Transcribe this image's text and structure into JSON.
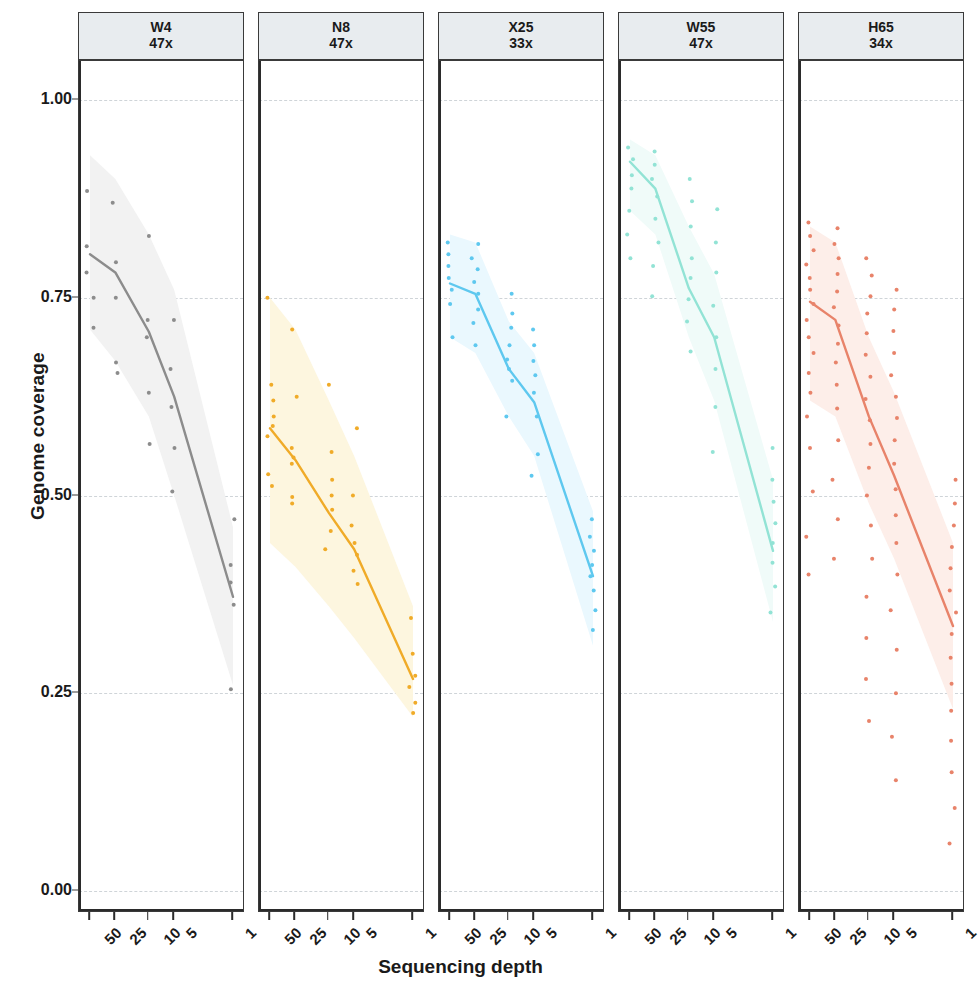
{
  "axes": {
    "y_title": "Genome coverage",
    "x_title": "Sequencing depth",
    "y_ticks": [
      "0.00",
      "0.25",
      "0.50",
      "0.75",
      "1.00"
    ],
    "x_ticks": [
      "50",
      "25",
      "10",
      "5",
      "1"
    ]
  },
  "panels": [
    {
      "name": "W4",
      "depth": "47x",
      "color": "#8c8c8c",
      "ribbon": "#f2f2f2"
    },
    {
      "name": "N8",
      "depth": "47x",
      "color": "#f0ab28",
      "ribbon": "#fdf6df"
    },
    {
      "name": "X25",
      "depth": "33x",
      "color": "#5ec8ef",
      "ribbon": "#eaf8fe"
    },
    {
      "name": "W55",
      "depth": "47x",
      "color": "#92e3d5",
      "ribbon": "#f0fbf9"
    },
    {
      "name": "H65",
      "depth": "34x",
      "color": "#e8836a",
      "ribbon": "#fdeee9"
    }
  ],
  "chart_data": {
    "type": "line",
    "title": "",
    "xlabel": "Sequencing depth",
    "ylabel": "Genome coverage",
    "x": [
      50,
      25,
      10,
      5,
      1
    ],
    "x_scale": "log-reversed",
    "ylim": [
      0.0,
      1.05
    ],
    "y_ticks": [
      0.0,
      0.25,
      0.5,
      0.75,
      1.0
    ],
    "grid": "horizontal-dashed",
    "legend": "none",
    "facets": [
      {
        "label": "W4",
        "sublabel": "47x",
        "color": "#8c8c8c",
        "ribbon_color": "#f2f2f2",
        "mean_line": [
          0.805,
          0.782,
          0.707,
          0.625,
          0.372
        ],
        "ribbon_upper": [
          0.93,
          0.9,
          0.83,
          0.76,
          0.46
        ],
        "ribbon_lower": [
          0.71,
          0.67,
          0.6,
          0.5,
          0.26
        ],
        "points": [
          {
            "x": 50,
            "y": 0.885
          },
          {
            "x": 50,
            "y": 0.815
          },
          {
            "x": 50,
            "y": 0.782
          },
          {
            "x": 50,
            "y": 0.75
          },
          {
            "x": 50,
            "y": 0.712
          },
          {
            "x": 25,
            "y": 0.87
          },
          {
            "x": 25,
            "y": 0.795
          },
          {
            "x": 25,
            "y": 0.75
          },
          {
            "x": 25,
            "y": 0.668
          },
          {
            "x": 25,
            "y": 0.655
          },
          {
            "x": 10,
            "y": 0.828
          },
          {
            "x": 10,
            "y": 0.722
          },
          {
            "x": 10,
            "y": 0.7
          },
          {
            "x": 10,
            "y": 0.63
          },
          {
            "x": 10,
            "y": 0.565
          },
          {
            "x": 5,
            "y": 0.722
          },
          {
            "x": 5,
            "y": 0.66
          },
          {
            "x": 5,
            "y": 0.612
          },
          {
            "x": 5,
            "y": 0.56
          },
          {
            "x": 5,
            "y": 0.505
          },
          {
            "x": 1,
            "y": 0.47
          },
          {
            "x": 1,
            "y": 0.412
          },
          {
            "x": 1,
            "y": 0.39
          },
          {
            "x": 1,
            "y": 0.362
          },
          {
            "x": 1,
            "y": 0.255
          }
        ]
      },
      {
        "label": "N8",
        "sublabel": "47x",
        "color": "#f0ab28",
        "ribbon_color": "#fdf6df",
        "mean_line": [
          0.585,
          0.545,
          0.478,
          0.432,
          0.268
        ],
        "ribbon_upper": [
          0.75,
          0.71,
          0.62,
          0.55,
          0.36
        ],
        "ribbon_lower": [
          0.44,
          0.41,
          0.36,
          0.32,
          0.22
        ],
        "points": [
          {
            "x": 50,
            "y": 0.75
          },
          {
            "x": 50,
            "y": 0.64
          },
          {
            "x": 50,
            "y": 0.62
          },
          {
            "x": 50,
            "y": 0.6
          },
          {
            "x": 50,
            "y": 0.588
          },
          {
            "x": 50,
            "y": 0.575
          },
          {
            "x": 50,
            "y": 0.527
          },
          {
            "x": 50,
            "y": 0.512
          },
          {
            "x": 25,
            "y": 0.71
          },
          {
            "x": 25,
            "y": 0.625
          },
          {
            "x": 25,
            "y": 0.56
          },
          {
            "x": 25,
            "y": 0.548
          },
          {
            "x": 25,
            "y": 0.54
          },
          {
            "x": 25,
            "y": 0.498
          },
          {
            "x": 25,
            "y": 0.49
          },
          {
            "x": 10,
            "y": 0.64
          },
          {
            "x": 10,
            "y": 0.555
          },
          {
            "x": 10,
            "y": 0.52
          },
          {
            "x": 10,
            "y": 0.5
          },
          {
            "x": 10,
            "y": 0.482
          },
          {
            "x": 10,
            "y": 0.455
          },
          {
            "x": 10,
            "y": 0.432
          },
          {
            "x": 5,
            "y": 0.585
          },
          {
            "x": 5,
            "y": 0.5
          },
          {
            "x": 5,
            "y": 0.462
          },
          {
            "x": 5,
            "y": 0.44
          },
          {
            "x": 5,
            "y": 0.425
          },
          {
            "x": 5,
            "y": 0.405
          },
          {
            "x": 5,
            "y": 0.388
          },
          {
            "x": 1,
            "y": 0.345
          },
          {
            "x": 1,
            "y": 0.3
          },
          {
            "x": 1,
            "y": 0.272
          },
          {
            "x": 1,
            "y": 0.258
          },
          {
            "x": 1,
            "y": 0.238
          },
          {
            "x": 1,
            "y": 0.225
          }
        ]
      },
      {
        "label": "X25",
        "sublabel": "33x",
        "color": "#5ec8ef",
        "ribbon_color": "#eaf8fe",
        "mean_line": [
          0.768,
          0.755,
          0.66,
          0.618,
          0.398
        ],
        "ribbon_upper": [
          0.83,
          0.82,
          0.72,
          0.68,
          0.48
        ],
        "ribbon_lower": [
          0.7,
          0.68,
          0.6,
          0.55,
          0.31
        ],
        "points": [
          {
            "x": 50,
            "y": 0.82
          },
          {
            "x": 50,
            "y": 0.805
          },
          {
            "x": 50,
            "y": 0.79
          },
          {
            "x": 50,
            "y": 0.775
          },
          {
            "x": 50,
            "y": 0.76
          },
          {
            "x": 50,
            "y": 0.742
          },
          {
            "x": 50,
            "y": 0.7
          },
          {
            "x": 25,
            "y": 0.818
          },
          {
            "x": 25,
            "y": 0.8
          },
          {
            "x": 25,
            "y": 0.786
          },
          {
            "x": 25,
            "y": 0.77
          },
          {
            "x": 25,
            "y": 0.755
          },
          {
            "x": 25,
            "y": 0.735
          },
          {
            "x": 25,
            "y": 0.718
          },
          {
            "x": 25,
            "y": 0.69
          },
          {
            "x": 10,
            "y": 0.755
          },
          {
            "x": 10,
            "y": 0.73
          },
          {
            "x": 10,
            "y": 0.712
          },
          {
            "x": 10,
            "y": 0.69
          },
          {
            "x": 10,
            "y": 0.672
          },
          {
            "x": 10,
            "y": 0.66
          },
          {
            "x": 10,
            "y": 0.645
          },
          {
            "x": 10,
            "y": 0.6
          },
          {
            "x": 5,
            "y": 0.71
          },
          {
            "x": 5,
            "y": 0.69
          },
          {
            "x": 5,
            "y": 0.67
          },
          {
            "x": 5,
            "y": 0.652
          },
          {
            "x": 5,
            "y": 0.63
          },
          {
            "x": 5,
            "y": 0.6
          },
          {
            "x": 5,
            "y": 0.552
          },
          {
            "x": 5,
            "y": 0.525
          },
          {
            "x": 1,
            "y": 0.47
          },
          {
            "x": 1,
            "y": 0.448
          },
          {
            "x": 1,
            "y": 0.43
          },
          {
            "x": 1,
            "y": 0.412
          },
          {
            "x": 1,
            "y": 0.398
          },
          {
            "x": 1,
            "y": 0.38
          },
          {
            "x": 1,
            "y": 0.355
          },
          {
            "x": 1,
            "y": 0.33
          }
        ]
      },
      {
        "label": "W55",
        "sublabel": "47x",
        "color": "#92e3d5",
        "ribbon_color": "#f0fbf9",
        "mean_line": [
          0.922,
          0.888,
          0.762,
          0.7,
          0.43
        ],
        "ribbon_upper": [
          0.95,
          0.93,
          0.84,
          0.78,
          0.52
        ],
        "ribbon_lower": [
          0.86,
          0.83,
          0.7,
          0.62,
          0.34
        ],
        "points": [
          {
            "x": 50,
            "y": 0.94
          },
          {
            "x": 50,
            "y": 0.925
          },
          {
            "x": 50,
            "y": 0.905
          },
          {
            "x": 50,
            "y": 0.888
          },
          {
            "x": 50,
            "y": 0.86
          },
          {
            "x": 50,
            "y": 0.83
          },
          {
            "x": 50,
            "y": 0.8
          },
          {
            "x": 25,
            "y": 0.935
          },
          {
            "x": 25,
            "y": 0.918
          },
          {
            "x": 25,
            "y": 0.9
          },
          {
            "x": 25,
            "y": 0.878
          },
          {
            "x": 25,
            "y": 0.85
          },
          {
            "x": 25,
            "y": 0.82
          },
          {
            "x": 25,
            "y": 0.79
          },
          {
            "x": 25,
            "y": 0.752
          },
          {
            "x": 10,
            "y": 0.9
          },
          {
            "x": 10,
            "y": 0.872
          },
          {
            "x": 10,
            "y": 0.84
          },
          {
            "x": 10,
            "y": 0.8
          },
          {
            "x": 10,
            "y": 0.775
          },
          {
            "x": 10,
            "y": 0.748
          },
          {
            "x": 10,
            "y": 0.72
          },
          {
            "x": 10,
            "y": 0.682
          },
          {
            "x": 5,
            "y": 0.862
          },
          {
            "x": 5,
            "y": 0.82
          },
          {
            "x": 5,
            "y": 0.782
          },
          {
            "x": 5,
            "y": 0.74
          },
          {
            "x": 5,
            "y": 0.7
          },
          {
            "x": 5,
            "y": 0.66
          },
          {
            "x": 5,
            "y": 0.612
          },
          {
            "x": 5,
            "y": 0.555
          },
          {
            "x": 1,
            "y": 0.56
          },
          {
            "x": 1,
            "y": 0.52
          },
          {
            "x": 1,
            "y": 0.492
          },
          {
            "x": 1,
            "y": 0.465
          },
          {
            "x": 1,
            "y": 0.44
          },
          {
            "x": 1,
            "y": 0.415
          },
          {
            "x": 1,
            "y": 0.385
          },
          {
            "x": 1,
            "y": 0.352
          }
        ]
      },
      {
        "label": "H65",
        "sublabel": "34x",
        "color": "#e8836a",
        "ribbon_color": "#fdeee9",
        "mean_line": [
          0.745,
          0.722,
          0.6,
          0.525,
          0.335
        ],
        "ribbon_upper": [
          0.84,
          0.82,
          0.7,
          0.63,
          0.44
        ],
        "ribbon_lower": [
          0.62,
          0.6,
          0.49,
          0.42,
          0.23
        ],
        "points": [
          {
            "x": 50,
            "y": 0.845
          },
          {
            "x": 50,
            "y": 0.828
          },
          {
            "x": 50,
            "y": 0.81
          },
          {
            "x": 50,
            "y": 0.792
          },
          {
            "x": 50,
            "y": 0.775
          },
          {
            "x": 50,
            "y": 0.76
          },
          {
            "x": 50,
            "y": 0.742
          },
          {
            "x": 50,
            "y": 0.722
          },
          {
            "x": 50,
            "y": 0.7
          },
          {
            "x": 50,
            "y": 0.68
          },
          {
            "x": 50,
            "y": 0.655
          },
          {
            "x": 50,
            "y": 0.63
          },
          {
            "x": 50,
            "y": 0.6
          },
          {
            "x": 50,
            "y": 0.56
          },
          {
            "x": 50,
            "y": 0.505
          },
          {
            "x": 50,
            "y": 0.448
          },
          {
            "x": 50,
            "y": 0.4
          },
          {
            "x": 25,
            "y": 0.838
          },
          {
            "x": 25,
            "y": 0.818
          },
          {
            "x": 25,
            "y": 0.8
          },
          {
            "x": 25,
            "y": 0.78
          },
          {
            "x": 25,
            "y": 0.758
          },
          {
            "x": 25,
            "y": 0.738
          },
          {
            "x": 25,
            "y": 0.715
          },
          {
            "x": 25,
            "y": 0.692
          },
          {
            "x": 25,
            "y": 0.668
          },
          {
            "x": 25,
            "y": 0.64
          },
          {
            "x": 25,
            "y": 0.61
          },
          {
            "x": 25,
            "y": 0.57
          },
          {
            "x": 25,
            "y": 0.52
          },
          {
            "x": 25,
            "y": 0.47
          },
          {
            "x": 25,
            "y": 0.42
          },
          {
            "x": 10,
            "y": 0.8
          },
          {
            "x": 10,
            "y": 0.778
          },
          {
            "x": 10,
            "y": 0.752
          },
          {
            "x": 10,
            "y": 0.73
          },
          {
            "x": 10,
            "y": 0.705
          },
          {
            "x": 10,
            "y": 0.678
          },
          {
            "x": 10,
            "y": 0.65
          },
          {
            "x": 10,
            "y": 0.622
          },
          {
            "x": 10,
            "y": 0.595
          },
          {
            "x": 10,
            "y": 0.565
          },
          {
            "x": 10,
            "y": 0.535
          },
          {
            "x": 10,
            "y": 0.5
          },
          {
            "x": 10,
            "y": 0.462
          },
          {
            "x": 10,
            "y": 0.42
          },
          {
            "x": 10,
            "y": 0.372
          },
          {
            "x": 10,
            "y": 0.32
          },
          {
            "x": 10,
            "y": 0.268
          },
          {
            "x": 10,
            "y": 0.215
          },
          {
            "x": 5,
            "y": 0.76
          },
          {
            "x": 5,
            "y": 0.735
          },
          {
            "x": 5,
            "y": 0.708
          },
          {
            "x": 5,
            "y": 0.68
          },
          {
            "x": 5,
            "y": 0.652
          },
          {
            "x": 5,
            "y": 0.625
          },
          {
            "x": 5,
            "y": 0.598
          },
          {
            "x": 5,
            "y": 0.57
          },
          {
            "x": 5,
            "y": 0.54
          },
          {
            "x": 5,
            "y": 0.508
          },
          {
            "x": 5,
            "y": 0.475
          },
          {
            "x": 5,
            "y": 0.44
          },
          {
            "x": 5,
            "y": 0.4
          },
          {
            "x": 5,
            "y": 0.355
          },
          {
            "x": 5,
            "y": 0.305
          },
          {
            "x": 5,
            "y": 0.25
          },
          {
            "x": 5,
            "y": 0.195
          },
          {
            "x": 5,
            "y": 0.14
          },
          {
            "x": 1,
            "y": 0.52
          },
          {
            "x": 1,
            "y": 0.49
          },
          {
            "x": 1,
            "y": 0.462
          },
          {
            "x": 1,
            "y": 0.435
          },
          {
            "x": 1,
            "y": 0.408
          },
          {
            "x": 1,
            "y": 0.38
          },
          {
            "x": 1,
            "y": 0.352
          },
          {
            "x": 1,
            "y": 0.325
          },
          {
            "x": 1,
            "y": 0.295
          },
          {
            "x": 1,
            "y": 0.262
          },
          {
            "x": 1,
            "y": 0.228
          },
          {
            "x": 1,
            "y": 0.19
          },
          {
            "x": 1,
            "y": 0.15
          },
          {
            "x": 1,
            "y": 0.105
          },
          {
            "x": 1,
            "y": 0.06
          }
        ]
      }
    ]
  }
}
